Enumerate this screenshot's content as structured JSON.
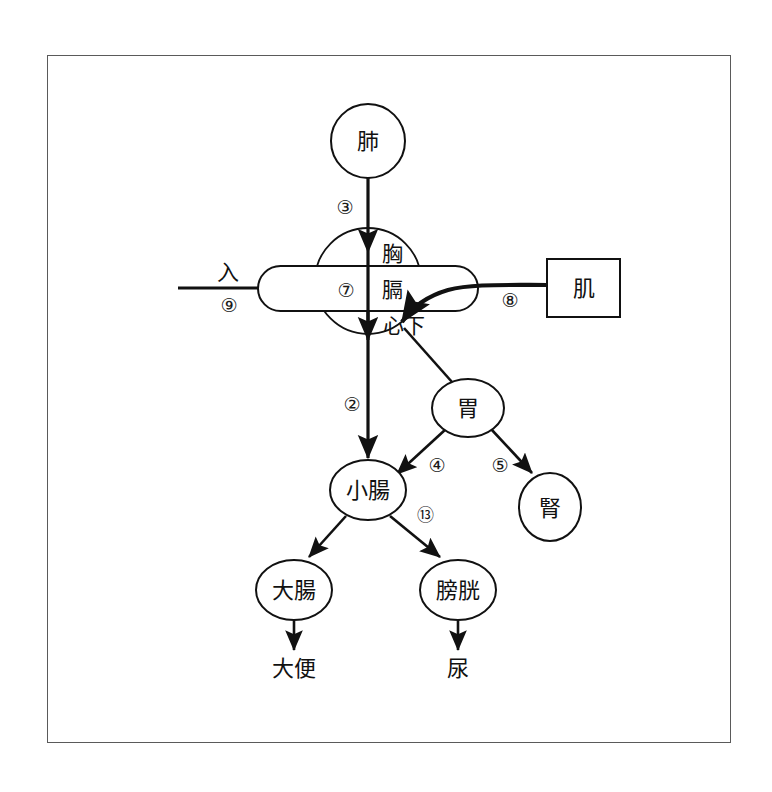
{
  "figure": {
    "type": "flow-diagram",
    "border_color": "#5a5a5a",
    "stroke_color": "#111111",
    "background": "#ffffff"
  },
  "nodes": {
    "lung": {
      "label": "肺",
      "shape": "circle",
      "cx": 368,
      "cy": 141,
      "r": 37
    },
    "center_circle": {
      "shape": "circle",
      "cx": 368,
      "cy": 281,
      "r": 53
    },
    "center_band": {
      "shape": "rounded-rect",
      "x": 258,
      "y": 266,
      "w": 220,
      "h": 45
    },
    "chest": {
      "label": "胸",
      "x": 392,
      "y": 252
    },
    "diaphragm": {
      "label": "膈",
      "x": 392,
      "y": 289
    },
    "below_heart": {
      "label": "心下",
      "x": 404,
      "y": 325
    },
    "muscle": {
      "label": "肌",
      "shape": "rect",
      "x": 547,
      "y": 259,
      "w": 73,
      "h": 58
    },
    "stomach": {
      "label": "胃",
      "shape": "ellipse",
      "cx": 468,
      "cy": 408,
      "rx": 36,
      "ry": 29
    },
    "kidney": {
      "label": "腎",
      "shape": "ellipse",
      "cx": 550,
      "cy": 507,
      "rx": 31,
      "ry": 34
    },
    "small_intestine": {
      "label": "小腸",
      "shape": "ellipse",
      "cx": 368,
      "cy": 490,
      "rx": 38,
      "ry": 30
    },
    "large_intestine": {
      "label": "大腸",
      "shape": "ellipse",
      "cx": 294,
      "cy": 590,
      "rx": 38,
      "ry": 30
    },
    "bladder": {
      "label": "膀胱",
      "shape": "ellipse",
      "cx": 458,
      "cy": 590,
      "rx": 38,
      "ry": 30
    },
    "feces": {
      "label": "大便",
      "x": 294,
      "y": 668
    },
    "urine": {
      "label": "尿",
      "x": 458,
      "y": 668
    },
    "intake": {
      "label": "入",
      "x": 228,
      "y": 272
    }
  },
  "flow_numbers": {
    "n2": {
      "label": "②",
      "x": 352,
      "y": 404
    },
    "n3": {
      "label": "③",
      "x": 345,
      "y": 207
    },
    "n4": {
      "label": "④",
      "x": 437,
      "y": 465
    },
    "n5": {
      "label": "⑤",
      "x": 500,
      "y": 465
    },
    "n7": {
      "label": "⑦",
      "x": 346,
      "y": 290
    },
    "n8": {
      "label": "⑧",
      "x": 510,
      "y": 300
    },
    "n9": {
      "label": "⑨",
      "x": 229,
      "y": 305
    },
    "n13": {
      "label": "⑬",
      "x": 425,
      "y": 514
    }
  },
  "edges": [
    {
      "name": "lung-to-chest",
      "from": "lung",
      "to": "chest",
      "number": "③"
    },
    {
      "name": "intake-to-band",
      "from": "入",
      "to": "center_band",
      "number": "⑨"
    },
    {
      "name": "muscle-to-below-heart",
      "from": "肌",
      "to": "心下",
      "number": "⑧"
    },
    {
      "name": "center-to-small-intestine",
      "from": "心下",
      "to": "小腸",
      "number": "②"
    },
    {
      "name": "below-heart-to-stomach",
      "from": "心下",
      "to": "胃",
      "number": ""
    },
    {
      "name": "stomach-to-small-intestine",
      "from": "胃",
      "to": "小腸",
      "number": "④"
    },
    {
      "name": "stomach-to-kidney",
      "from": "胃",
      "to": "腎",
      "number": "⑤"
    },
    {
      "name": "small-intestine-to-large-intestine",
      "from": "小腸",
      "to": "大腸",
      "number": ""
    },
    {
      "name": "small-intestine-to-bladder",
      "from": "小腸",
      "to": "膀胱",
      "number": "⑬"
    },
    {
      "name": "large-intestine-to-feces",
      "from": "大腸",
      "to": "大便",
      "number": ""
    },
    {
      "name": "bladder-to-urine",
      "from": "膀胱",
      "to": "尿",
      "number": ""
    }
  ]
}
